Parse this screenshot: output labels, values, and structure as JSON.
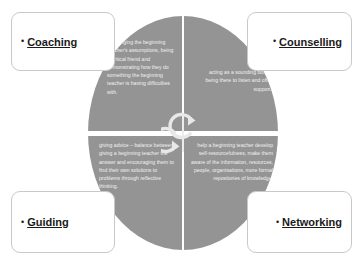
{
  "diagram": {
    "colors": {
      "circle_fill": "#949494",
      "divider": "#ffffff",
      "quadrant_text": "#f2f2f2",
      "label_text": "#1a1a1a",
      "box_border": "#c9c9c9",
      "background": "#ffffff"
    },
    "center_icon": "cycle-arrows-icon",
    "labels": [
      {
        "id": "coaching",
        "bullet": "•",
        "text": "Coaching",
        "position": "top-left"
      },
      {
        "id": "counselling",
        "bullet": "•",
        "text": "Counselling",
        "position": "top-right"
      },
      {
        "id": "guiding",
        "bullet": "•",
        "text": "Guiding",
        "position": "bottom-left"
      },
      {
        "id": "networking",
        "bullet": "•",
        "text": "Networking",
        "position": "bottom-right"
      }
    ],
    "quadrants": [
      {
        "id": "coaching",
        "position": "top-left",
        "text": "challenging the beginning teacher's assumptions, being a critical friend and demonstrating how they do something the beginning teacher is having difficulties with."
      },
      {
        "id": "counselling",
        "position": "top-right",
        "text": "acting as a sounding board, being there to listen and offer support."
      },
      {
        "id": "guiding",
        "position": "bottom-left",
        "text": "giving advice – balance between giving a beginning teacher the answer and encouraging them to find their own solutions to problems through reflective thinking."
      },
      {
        "id": "networking",
        "position": "bottom-right",
        "text": "help a beginning teacher develop self-resourcefulness, make them aware of the information, resources, people, organisations, more formal repositories of knowledge."
      }
    ]
  }
}
